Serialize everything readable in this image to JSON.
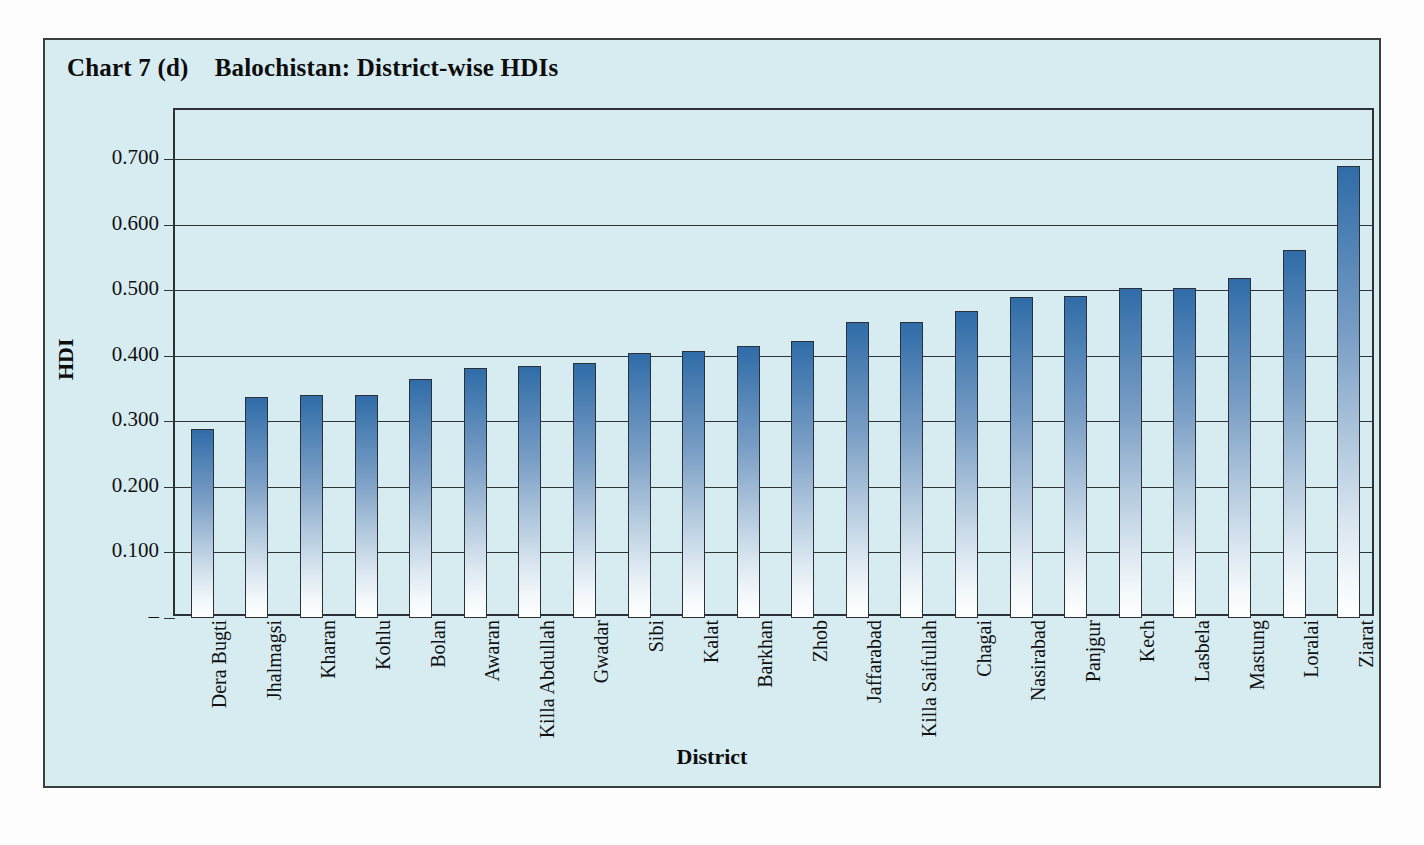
{
  "chart_data": {
    "type": "bar",
    "title_number": "Chart 7 (d)",
    "title_text": "Balochistan: District-wise HDIs",
    "xlabel": "District",
    "ylabel": "HDI",
    "ylim": [
      0,
      0.775
    ],
    "grid": true,
    "legend": "none",
    "ytick_labels": [
      "0.700",
      "0.600",
      "0.500",
      "0.400",
      "0.300",
      "0.200",
      "0.100",
      "–"
    ],
    "ytick_values": [
      0.7,
      0.6,
      0.5,
      0.4,
      0.3,
      0.2,
      0.1,
      0.0
    ],
    "categories": [
      "Dera Bugti",
      "Jhalmagsi",
      "Kharan",
      "Kohlu",
      "Bolan",
      "Awaran",
      "Killa Abdullah",
      "Gwadar",
      "Sibi",
      "Kalat",
      "Barkhan",
      "Zhob",
      "Jaffarabad",
      "Killa Saifullah",
      "Chagai",
      "Nasirabad",
      "Panjgur",
      "Kech",
      "Lasbela",
      "Mastung",
      "Loralai",
      "Ziarat"
    ],
    "values": [
      0.288,
      0.337,
      0.34,
      0.34,
      0.365,
      0.381,
      0.384,
      0.389,
      0.405,
      0.408,
      0.415,
      0.423,
      0.452,
      0.452,
      0.468,
      0.489,
      0.491,
      0.503,
      0.503,
      0.519,
      0.561,
      0.689
    ],
    "series_name": "HDI",
    "colors": {
      "background": "#d7ecf1",
      "bar_top": "#2f6ca8",
      "bar_bottom": "#ffffff",
      "axis": "#2c3135",
      "text": "#0d0d0d"
    }
  }
}
